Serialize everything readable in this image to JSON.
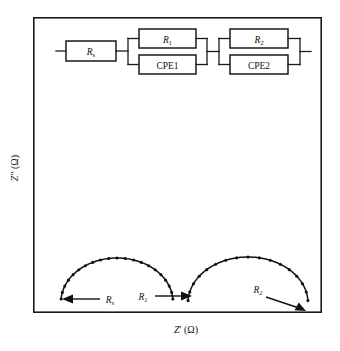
{
  "figure": {
    "frame": {
      "x": 33,
      "y": 17,
      "width": 289,
      "height": 296,
      "stroke": "#1a1a1a"
    }
  },
  "circuit": {
    "name": "equivalent-circuit-diagram",
    "components": [
      {
        "id": "rs",
        "label": "R",
        "subscript": "s",
        "italic": true,
        "x": 66,
        "y": 41,
        "width": 50,
        "height": 20
      },
      {
        "id": "r1",
        "label": "R",
        "subscript": "1",
        "italic": true,
        "x": 139,
        "y": 29,
        "width": 57,
        "height": 19
      },
      {
        "id": "cpe1",
        "label": "CPE1",
        "subscript": "",
        "italic": false,
        "x": 139,
        "y": 55,
        "width": 57,
        "height": 19
      },
      {
        "id": "r2",
        "label": "R",
        "subscript": "2",
        "italic": true,
        "x": 230,
        "y": 29,
        "width": 58,
        "height": 19
      },
      {
        "id": "cpe2",
        "label": "CPE2",
        "subscript": "",
        "italic": false,
        "x": 230,
        "y": 55,
        "width": 58,
        "height": 19
      }
    ]
  },
  "axes": {
    "x_label_main": "Z",
    "x_label_prime": "'",
    "x_label_unit": "(Ω)",
    "x_label_full": "Z' (Ω)",
    "y_label_main": "Z",
    "y_label_prime": "\"",
    "y_label_unit": "(Ω)",
    "y_label_full": "Z\" (Ω)"
  },
  "annotations": [
    {
      "id": "ann-rs",
      "label": "R",
      "subscript": "s",
      "text_x": 108,
      "text_y": 303,
      "arrow_from_x": 101,
      "arrow_from_y": 299,
      "arrow_to_x": 63,
      "arrow_to_y": 299
    },
    {
      "id": "ann-r1",
      "label": "R",
      "subscript": "1",
      "text_x": 142,
      "text_y": 300,
      "arrow_from_x": 155,
      "arrow_from_y": 296,
      "arrow_to_x": 191,
      "arrow_to_y": 296
    },
    {
      "id": "ann-r2",
      "label": "R",
      "subscript": "2",
      "text_x": 258,
      "text_y": 293,
      "arrow_from_x": 266,
      "arrow_from_y": 296,
      "arrow_to_x": 303,
      "arrow_to_y": 310
    }
  ],
  "chart_data": {
    "type": "scatter",
    "title": "",
    "xlabel": "Z' (Ω)",
    "ylabel": "Z\" (Ω)",
    "grid": false,
    "legend": "none",
    "note": "Two depressed semicircular arcs typical of an EIS Nyquist spectrum; no numeric tick labels are printed on either axis.",
    "xlim": [
      0,
      1
    ],
    "ylim": [
      0,
      1
    ],
    "series": [
      {
        "name": "arc-1",
        "marker": "filled-circle",
        "arc": {
          "center_x": 117,
          "center_y": 302,
          "radius_x": 56,
          "radius_y": 44
        },
        "x": [
          0.163,
          0.166,
          0.173,
          0.185,
          0.201,
          0.222,
          0.247,
          0.276,
          0.309,
          0.344,
          0.381,
          0.419,
          0.456,
          0.492,
          0.525,
          0.555,
          0.581,
          0.602,
          0.617,
          0.626,
          0.63
        ],
        "y": [
          0.022,
          0.055,
          0.087,
          0.118,
          0.147,
          0.174,
          0.198,
          0.217,
          0.233,
          0.243,
          0.248,
          0.247,
          0.241,
          0.23,
          0.214,
          0.193,
          0.169,
          0.141,
          0.11,
          0.077,
          0.043
        ]
      },
      {
        "name": "arc-2",
        "marker": "filled-circle",
        "arc": {
          "center_x": 248,
          "center_y": 303,
          "radius_x": 60,
          "radius_y": 46
        },
        "x": [
          0.633,
          0.637,
          0.646,
          0.659,
          0.677,
          0.699,
          0.725,
          0.754,
          0.785,
          0.818,
          0.852,
          0.885,
          0.916,
          0.944,
          0.968,
          0.987,
          1.0
        ],
        "y": [
          0.03,
          0.068,
          0.105,
          0.141,
          0.174,
          0.204,
          0.23,
          0.251,
          0.263,
          0.268,
          0.264,
          0.252,
          0.233,
          0.207,
          0.174,
          0.124,
          0.035
        ]
      }
    ]
  }
}
